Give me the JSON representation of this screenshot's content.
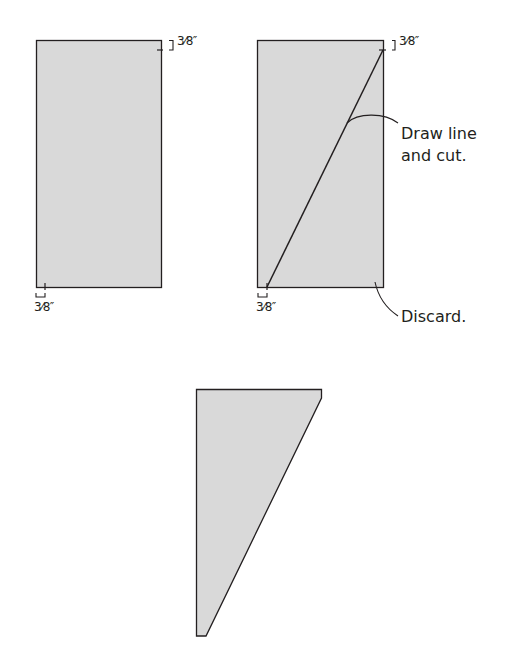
{
  "colors": {
    "fill": "#d9d9d9",
    "stroke": "#231f20",
    "background": "#ffffff"
  },
  "panels": {
    "step1": {
      "shape": "rectangle",
      "top_offset_label": "3⁄8″",
      "bottom_offset_label": "3⁄8″"
    },
    "step2": {
      "shape": "rectangle-with-diagonal",
      "top_offset_label": "3⁄8″",
      "bottom_offset_label": "3⁄8″",
      "callout_cut": "Draw line\nand cut.",
      "callout_cut_line1": "Draw line",
      "callout_cut_line2": "and cut.",
      "callout_discard": "Discard."
    },
    "step3": {
      "shape": "tapered-piece"
    }
  }
}
